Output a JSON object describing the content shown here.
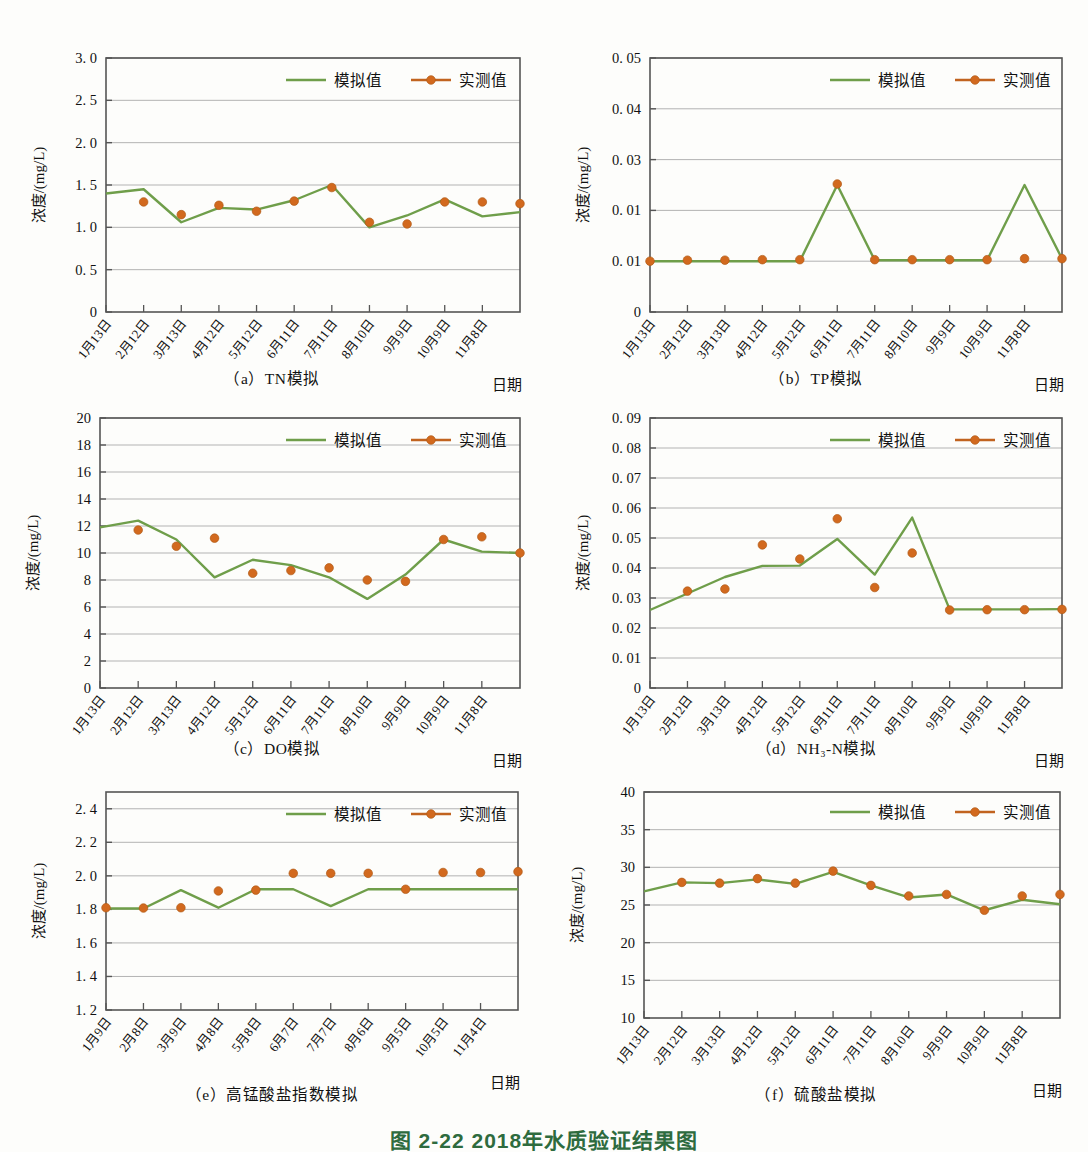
{
  "page": {
    "ghost_text_top": "",
    "figure_caption": "图 2-22  2018年水质验证结果图",
    "axis_y_label": "浓度/(mg/L)",
    "axis_x_label": "日期",
    "legend": {
      "simulated": "模拟值",
      "measured": "实测值"
    },
    "colors": {
      "simulated_line": "#6f9e4a",
      "measured_line": "#c1631f",
      "measured_marker": "#d2691e",
      "axis": "#555555",
      "grid": "#aaaaaa",
      "caption_green": "#2e6b3e"
    }
  },
  "dates_13": [
    "1月13日",
    "2月12日",
    "3月13日",
    "4月12日",
    "5月12日",
    "6月11日",
    "7月11日",
    "8月10日",
    "9月9日",
    "10月9日",
    "11月8日"
  ],
  "dates_e": [
    "1月9日",
    "2月8日",
    "3月9日",
    "4月8日",
    "5月8日",
    "6月7日",
    "7月7日",
    "8月6日",
    "9月5日",
    "10月5日",
    "11月4日"
  ],
  "chart_data": [
    {
      "id": "a",
      "type": "line",
      "title": "（a）TN模拟",
      "xlabel": "日期",
      "ylabel": "浓度/(mg/L)",
      "ylim": [
        0,
        3.0
      ],
      "yticks": [
        0,
        0.5,
        1.0,
        1.5,
        2.0,
        2.5,
        3.0
      ],
      "ytick_labels": [
        "0",
        "0. 5",
        "1. 0",
        "1. 5",
        "2. 0",
        "2. 5",
        "3. 0"
      ],
      "grid": true,
      "legend_position": "top-right",
      "categories": [
        "1月13日",
        "2月12日",
        "3月13日",
        "4月12日",
        "5月12日",
        "6月11日",
        "7月11日",
        "8月10日",
        "9月9日",
        "10月9日",
        "11月8日"
      ],
      "series": [
        {
          "name": "模拟值",
          "values": [
            1.4,
            1.45,
            1.06,
            1.23,
            1.21,
            1.32,
            1.5,
            1.0,
            1.14,
            1.33,
            1.13,
            1.18
          ]
        },
        {
          "name": "实测值",
          "values": [
            null,
            1.3,
            1.15,
            1.26,
            1.19,
            1.31,
            1.47,
            1.06,
            1.04,
            1.3,
            1.3,
            1.28
          ]
        }
      ]
    },
    {
      "id": "b",
      "type": "line",
      "title": "（b）TP模拟",
      "xlabel": "日期",
      "ylabel": "浓度/(mg/L)",
      "ylim": [
        0,
        0.05
      ],
      "yticks": [
        0,
        0.01,
        0.02,
        0.03,
        0.04,
        0.05
      ],
      "ytick_labels": [
        "0",
        "0. 01",
        "0. 01",
        "0. 03",
        "0. 04",
        "0. 05"
      ],
      "grid": true,
      "legend_position": "top-right",
      "categories": [
        "1月13日",
        "2月12日",
        "3月13日",
        "4月12日",
        "5月12日",
        "6月11日",
        "7月11日",
        "8月10日",
        "9月9日",
        "10月9日",
        "11月8日"
      ],
      "series": [
        {
          "name": "模拟值",
          "values": [
            0.01,
            0.01,
            0.01,
            0.01,
            0.01,
            0.025,
            0.0102,
            0.0102,
            0.0102,
            0.0102,
            0.025,
            0.0105
          ]
        },
        {
          "name": "实测值",
          "values": [
            0.01,
            0.0102,
            0.0102,
            0.0103,
            0.0103,
            0.0252,
            0.0103,
            0.0103,
            0.0103,
            0.0103,
            0.0105,
            0.0105
          ]
        }
      ]
    },
    {
      "id": "c",
      "type": "line",
      "title": "（c）DO模拟",
      "xlabel": "日期",
      "ylabel": "浓度/(mg/L)",
      "ylim": [
        0,
        20
      ],
      "yticks": [
        0,
        2,
        4,
        6,
        8,
        10,
        12,
        14,
        16,
        18,
        20
      ],
      "ytick_labels": [
        "0",
        "2",
        "4",
        "6",
        "8",
        "10",
        "12",
        "14",
        "16",
        "18",
        "20"
      ],
      "grid": true,
      "legend_position": "top-right",
      "categories": [
        "1月13日",
        "2月12日",
        "3月13日",
        "4月12日",
        "5月12日",
        "6月11日",
        "7月11日",
        "8月10日",
        "9月9日",
        "10月9日",
        "11月8日"
      ],
      "series": [
        {
          "name": "模拟值",
          "values": [
            11.9,
            12.4,
            11.0,
            8.2,
            9.5,
            9.1,
            8.2,
            6.6,
            8.4,
            11.0,
            10.1,
            10.0
          ]
        },
        {
          "name": "实测值",
          "values": [
            null,
            11.7,
            10.5,
            11.1,
            8.5,
            8.7,
            8.9,
            8.0,
            7.9,
            11.0,
            11.2,
            10.0
          ]
        }
      ]
    },
    {
      "id": "d",
      "type": "line",
      "title": "（d）NH₃-N模拟",
      "xlabel": "日期",
      "ylabel": "浓度/(mg/L)",
      "ylim": [
        0,
        0.09
      ],
      "yticks": [
        0,
        0.01,
        0.02,
        0.03,
        0.04,
        0.05,
        0.06,
        0.07,
        0.08,
        0.09
      ],
      "ytick_labels": [
        "0",
        "0. 01",
        "0. 02",
        "0. 03",
        "0. 04",
        "0. 05",
        "0. 06",
        "0. 07",
        "0. 08",
        "0. 09"
      ],
      "grid": true,
      "legend_position": "top-right",
      "categories": [
        "1月13日",
        "2月12日",
        "3月13日",
        "4月12日",
        "5月12日",
        "6月11日",
        "7月11日",
        "8月10日",
        "9月9日",
        "10月9日",
        "11月8日"
      ],
      "series": [
        {
          "name": "模拟值",
          "values": [
            0.026,
            0.0315,
            0.037,
            0.0407,
            0.0408,
            0.0497,
            0.0378,
            0.0568,
            0.0262,
            0.0262,
            0.0262,
            0.0263
          ]
        },
        {
          "name": "实测值",
          "values": [
            null,
            0.0323,
            0.033,
            0.0477,
            0.043,
            0.0564,
            0.0335,
            0.045,
            0.026,
            0.0261,
            0.0261,
            0.0262
          ]
        }
      ]
    },
    {
      "id": "e",
      "type": "line",
      "title": "（e）高锰酸盐指数模拟",
      "xlabel": "日期",
      "ylabel": "浓度/(mg/L)",
      "ylim": [
        1.2,
        2.5
      ],
      "yticks": [
        1.2,
        1.4,
        1.6,
        1.8,
        2.0,
        2.2,
        2.4
      ],
      "ytick_labels": [
        "1. 2",
        "1. 4",
        "1. 6",
        "1. 8",
        "2. 0",
        "2. 2",
        "2. 4"
      ],
      "grid": true,
      "legend_position": "top-right",
      "categories": [
        "1月9日",
        "2月8日",
        "3月9日",
        "4月8日",
        "5月8日",
        "6月7日",
        "7月7日",
        "8月6日",
        "9月5日",
        "10月5日",
        "11月4日"
      ],
      "series": [
        {
          "name": "模拟值",
          "values": [
            1.805,
            1.805,
            1.915,
            1.81,
            1.92,
            1.92,
            1.82,
            1.92,
            1.92,
            1.92,
            1.92,
            1.92
          ]
        },
        {
          "name": "实测值",
          "values": [
            1.81,
            1.808,
            1.81,
            1.91,
            1.915,
            2.015,
            2.015,
            2.015,
            1.92,
            2.02,
            2.02,
            2.025
          ]
        }
      ]
    },
    {
      "id": "f",
      "type": "line",
      "title": "（f）硫酸盐模拟",
      "xlabel": "日期",
      "ylabel": "浓度/(mg/L)",
      "ylim": [
        10,
        40
      ],
      "yticks": [
        10,
        15,
        20,
        25,
        30,
        35,
        40
      ],
      "ytick_labels": [
        "10",
        "15",
        "20",
        "25",
        "30",
        "35",
        "40"
      ],
      "grid": true,
      "legend_position": "top-right",
      "categories": [
        "1月13日",
        "2月12日",
        "3月13日",
        "4月12日",
        "5月12日",
        "6月11日",
        "7月11日",
        "8月10日",
        "9月9日",
        "10月9日",
        "11月8日"
      ],
      "series": [
        {
          "name": "模拟值",
          "values": [
            26.8,
            28.0,
            27.9,
            28.4,
            27.8,
            29.4,
            27.6,
            26.0,
            26.4,
            24.3,
            25.7,
            25.1
          ]
        },
        {
          "name": "实测值",
          "values": [
            null,
            28.0,
            27.9,
            28.5,
            27.9,
            29.5,
            27.6,
            26.2,
            26.4,
            24.3,
            26.2,
            26.4
          ]
        }
      ]
    }
  ]
}
